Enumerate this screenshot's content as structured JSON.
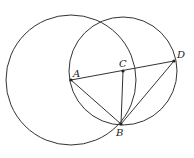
{
  "diagram": {
    "points": {
      "A": {
        "label": "A",
        "x": 71,
        "y": 80
      },
      "B": {
        "label": "B",
        "x": 121,
        "y": 124
      },
      "C": {
        "label": "C",
        "x": 123,
        "y": 71
      },
      "D": {
        "label": "D",
        "x": 174,
        "y": 61
      }
    },
    "circles": [
      {
        "center": "A",
        "r": 65
      },
      {
        "center": "C",
        "r": 54
      }
    ],
    "segments": [
      [
        "A",
        "D"
      ],
      [
        "A",
        "B"
      ],
      [
        "C",
        "B"
      ],
      [
        "D",
        "B"
      ]
    ],
    "stroke_color": "#333333"
  }
}
